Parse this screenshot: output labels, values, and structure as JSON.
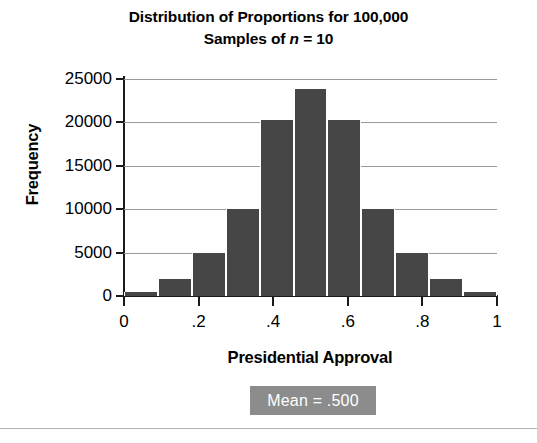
{
  "chart_data": {
    "type": "bar",
    "title_line1": "Distribution of Proportions for 100,000",
    "title_line2_pre": "Samples of ",
    "title_line2_var": "n",
    "title_line2_post": " = 10",
    "title": "Distribution of Proportions for 100,000 Samples of n = 10",
    "xlabel": "Presidential Approval",
    "ylabel": "Frequency",
    "categories": [
      "0",
      ".1",
      ".2",
      ".3",
      ".4",
      ".5",
      ".6",
      ".7",
      ".8",
      ".9",
      "1"
    ],
    "values": [
      500,
      2000,
      5000,
      10000,
      20300,
      23800,
      20300,
      10000,
      5000,
      2000,
      500
    ],
    "xlim": [
      0,
      1
    ],
    "ylim": [
      0,
      25000
    ],
    "ytick_labels": [
      "0",
      "5000",
      "10000",
      "15000",
      "20000",
      "25000"
    ],
    "ytick_values": [
      0,
      5000,
      10000,
      15000,
      20000,
      25000
    ],
    "xtick_labels": [
      "0",
      ".2",
      ".4",
      ".6",
      ".8",
      "1"
    ],
    "xtick_values": [
      0,
      0.2,
      0.4,
      0.6,
      0.8,
      1
    ],
    "grid": true,
    "legend": "none",
    "annotation": "Mean = .500",
    "bar_color": "#464646",
    "annotation_bg": "#8c8c8c",
    "annotation_color": "#ffffff",
    "grid_color": "#9a9a9a",
    "axis_color": "#1a1a1a"
  }
}
